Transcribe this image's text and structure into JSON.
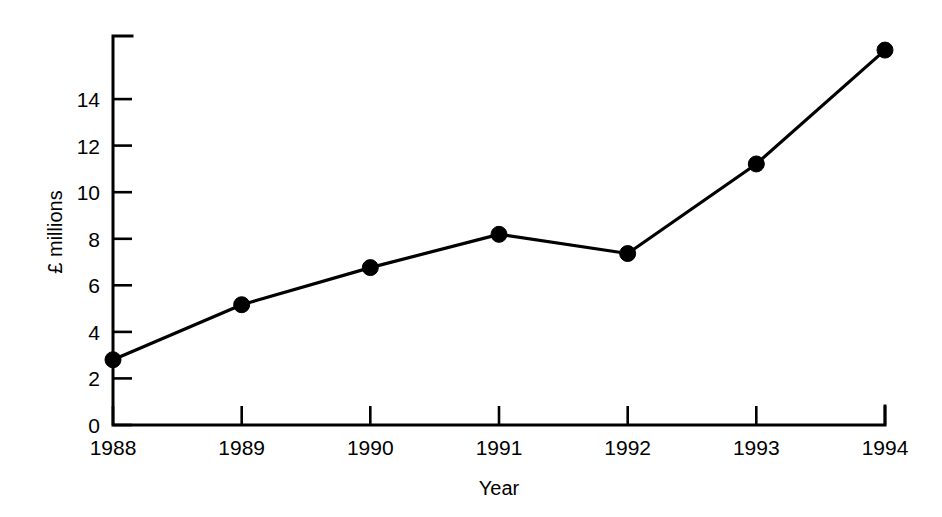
{
  "chart_data": {
    "type": "line",
    "title": "",
    "subtitle": "",
    "xlabel": "Year",
    "ylabel": "£ millions",
    "categories": [
      "1988",
      "1989",
      "1990",
      "1991",
      "1992",
      "1993",
      "1994"
    ],
    "values": [
      2.55,
      4.7,
      6.15,
      7.45,
      6.7,
      10.2,
      14.65
    ],
    "series": [
      {
        "name": "",
        "values": [
          2.55,
          4.7,
          6.15,
          7.45,
          6.7,
          10.2,
          14.65
        ]
      }
    ],
    "ylim": [
      0,
      15.2
    ],
    "yticks": [
      0,
      2,
      4,
      6,
      8,
      10,
      12,
      14
    ],
    "ytick_labels": [
      "0",
      "2",
      "4",
      "6",
      "8",
      "10",
      "12",
      "14"
    ],
    "xtick_labels": [
      "1988",
      "1989",
      "1990",
      "1991",
      "1992",
      "1993",
      "1994"
    ],
    "grid": false,
    "legend": false,
    "legend_position": "none",
    "marker": "filled-circle",
    "line_color": "#000000",
    "marker_color": "#000000",
    "background_color": "#ffffff"
  },
  "axes": {
    "y_title": "£ millions",
    "x_title": "Year"
  }
}
